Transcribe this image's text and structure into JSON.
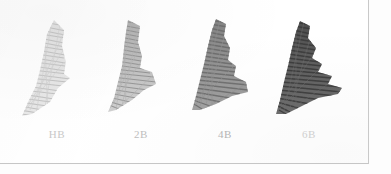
{
  "scan": {
    "background_color": "#fdfdfd",
    "paper_color": "#ffffff",
    "border_color": "#c9c9c9",
    "title": "Pencil grade shading swatch chart"
  },
  "swatches": [
    {
      "label": "HB",
      "grade": "HB",
      "order": 1,
      "darkness_percent": 16,
      "stroke_color": "#c2c2c2",
      "label_color": "#c8c8c8",
      "description": "light grey hatched triangular swatch"
    },
    {
      "label": "2B",
      "grade": "2B",
      "order": 2,
      "darkness_percent": 34,
      "stroke_color": "#9a9a9a",
      "label_color": "#bdbdbd",
      "description": "medium-light grey hatched triangular swatch"
    },
    {
      "label": "4B",
      "grade": "4B",
      "order": 3,
      "darkness_percent": 55,
      "stroke_color": "#7b7b7b",
      "label_color": "#b4b4b4",
      "description": "medium dark grey hatched triangular swatch"
    },
    {
      "label": "6B",
      "grade": "6B",
      "order": 4,
      "darkness_percent": 76,
      "stroke_color": "#4f4f4f",
      "label_color": "#cfcfcf",
      "description": "dark grey near-black hatched triangular swatch"
    }
  ]
}
